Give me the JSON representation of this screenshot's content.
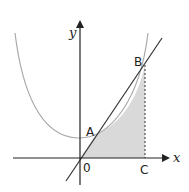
{
  "diagram": {
    "type": "function graph with tangent line and shaded region",
    "axes": {
      "x_label": "x",
      "y_label": "y",
      "origin_label": "0"
    },
    "points": {
      "A": "A",
      "B": "B",
      "C": "C"
    },
    "elements": [
      "U-shaped curve (gray)",
      "straight line through origin, A and B",
      "dashed vertical segment from B to C",
      "shaded region bounded by line O–A, curve A–B, dashed B–C, x-axis C–O"
    ],
    "colors": {
      "axis": "#222222",
      "line": "#333333",
      "curve": "#aaaaaa",
      "shade": "#d9d9d9",
      "dashed": "#444444"
    }
  }
}
